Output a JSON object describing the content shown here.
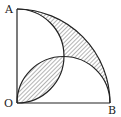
{
  "labels": {
    "A": "A",
    "O": "O",
    "B": "B"
  },
  "colors": {
    "stroke": "#222222",
    "hatch": "#444444",
    "background": "#ffffff"
  }
}
